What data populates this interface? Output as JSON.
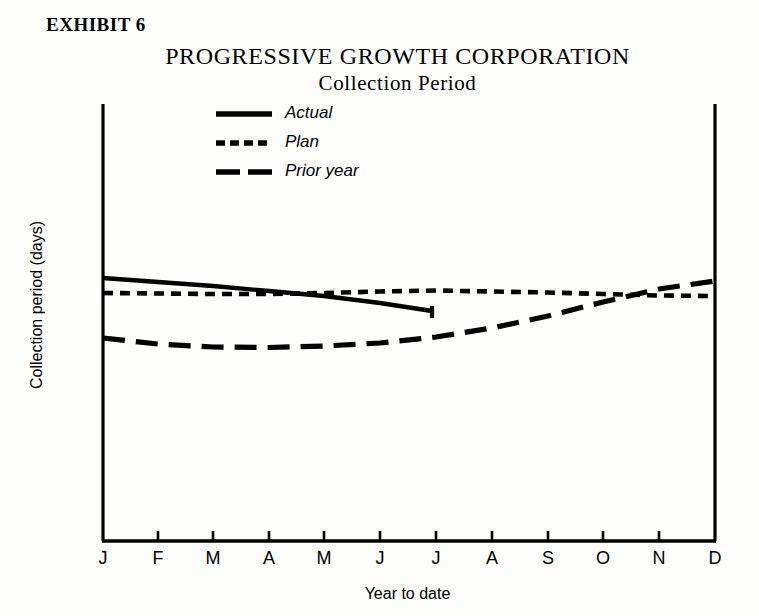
{
  "exhibit": {
    "label": "EXHIBIT 6"
  },
  "titles": {
    "company": "PROGRESSIVE GROWTH CORPORATION",
    "subtitle": "Collection Period"
  },
  "legend": {
    "position": "inside-top-left",
    "items": [
      {
        "label": "Actual",
        "style": "solid",
        "icon": "solid-line-icon"
      },
      {
        "label": "Plan",
        "style": "short-dash",
        "icon": "short-dashed-line-icon"
      },
      {
        "label": "Prior year",
        "style": "long-dash",
        "icon": "long-dashed-line-icon"
      }
    ]
  },
  "axes": {
    "xlabel": "Year to date",
    "ylabel": "Collection period (days)",
    "x_ticks": [
      "J",
      "F",
      "M",
      "A",
      "M",
      "J",
      "J",
      "A",
      "S",
      "O",
      "N",
      "D"
    ],
    "y_ticks": [],
    "grid": false
  },
  "colors": {
    "ink": "#000000",
    "paper": "#fdfdfc"
  },
  "chart_data": {
    "type": "line",
    "title": "PROGRESSIVE GROWTH CORPORATION",
    "subtitle": "Collection Period",
    "xlabel": "Year to date",
    "ylabel": "Collection period (days)",
    "categories": [
      "J",
      "F",
      "M",
      "A",
      "M",
      "J",
      "J",
      "A",
      "S",
      "O",
      "N",
      "D"
    ],
    "grid": false,
    "legend_position": "inside-top-left",
    "ylim": [
      0,
      100
    ],
    "series": [
      {
        "name": "Actual",
        "style": "solid",
        "values": [
          54.5,
          53.6,
          52.8,
          51.9,
          51.0,
          49.8,
          48.5,
          null,
          null,
          null,
          null,
          null
        ],
        "note": "Actual line stops at July (year-to-date reporting)"
      },
      {
        "name": "Plan",
        "style": "short-dash",
        "values": [
          51.3,
          51.2,
          51.1,
          51.1,
          51.3,
          51.6,
          51.8,
          51.6,
          51.4,
          51.1,
          50.8,
          50.7
        ]
      },
      {
        "name": "Prior year",
        "style": "long-dash",
        "values": [
          40.9,
          39.7,
          39.1,
          39.0,
          39.3,
          40.0,
          41.2,
          43.1,
          45.5,
          48.4,
          51.1,
          53.0
        ]
      }
    ]
  }
}
